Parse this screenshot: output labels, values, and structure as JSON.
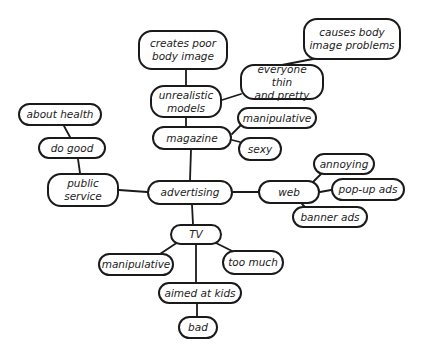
{
  "diagram": {
    "type": "mind-map",
    "central_topic": "advertising",
    "nodes": [
      {
        "id": "advertising",
        "label": "advertising",
        "x": 147,
        "y": 180,
        "w": 86,
        "h": 25
      },
      {
        "id": "magazine",
        "label": "magazine",
        "x": 152,
        "y": 126,
        "w": 80,
        "h": 24
      },
      {
        "id": "unrealistic_models",
        "label": "unrealistic\nmodels",
        "x": 150,
        "y": 85,
        "w": 72,
        "h": 33
      },
      {
        "id": "creates_poor_body_image",
        "label": "creates poor\nbody image",
        "x": 138,
        "y": 30,
        "w": 90,
        "h": 40
      },
      {
        "id": "everyone_thin_and_pretty",
        "label": "everyone thin\nand pretty",
        "x": 240,
        "y": 64,
        "w": 84,
        "h": 36
      },
      {
        "id": "causes_body_image_problems",
        "label": "causes body\nimage problems",
        "x": 303,
        "y": 18,
        "w": 98,
        "h": 42
      },
      {
        "id": "manipulative_mag",
        "label": "manipulative",
        "x": 237,
        "y": 107,
        "w": 80,
        "h": 22
      },
      {
        "id": "sexy",
        "label": "sexy",
        "x": 238,
        "y": 137,
        "w": 44,
        "h": 24
      },
      {
        "id": "public_service",
        "label": "public\nservice",
        "x": 47,
        "y": 173,
        "w": 72,
        "h": 34
      },
      {
        "id": "do_good",
        "label": "do good",
        "x": 38,
        "y": 137,
        "w": 68,
        "h": 22
      },
      {
        "id": "about_health",
        "label": "about health",
        "x": 18,
        "y": 103,
        "w": 84,
        "h": 23
      },
      {
        "id": "web",
        "label": "web",
        "x": 258,
        "y": 180,
        "w": 62,
        "h": 24
      },
      {
        "id": "annoying",
        "label": "annoying",
        "x": 313,
        "y": 153,
        "w": 62,
        "h": 22
      },
      {
        "id": "pop_up_ads",
        "label": "pop-up ads",
        "x": 331,
        "y": 178,
        "w": 74,
        "h": 23
      },
      {
        "id": "banner_ads",
        "label": "banner ads",
        "x": 292,
        "y": 206,
        "w": 76,
        "h": 22
      },
      {
        "id": "tv",
        "label": "TV",
        "x": 170,
        "y": 224,
        "w": 52,
        "h": 21
      },
      {
        "id": "manipulative_tv",
        "label": "manipulative",
        "x": 98,
        "y": 253,
        "w": 76,
        "h": 23
      },
      {
        "id": "too_much",
        "label": "too much",
        "x": 222,
        "y": 250,
        "w": 62,
        "h": 25
      },
      {
        "id": "aimed_at_kids",
        "label": "aimed at kids",
        "x": 158,
        "y": 282,
        "w": 84,
        "h": 22
      },
      {
        "id": "bad",
        "label": "bad",
        "x": 178,
        "y": 316,
        "w": 40,
        "h": 23
      }
    ],
    "edges": [
      {
        "from": "advertising",
        "to": "magazine",
        "x1": 190,
        "y1": 180,
        "x2": 191,
        "y2": 150
      },
      {
        "from": "magazine",
        "to": "unrealistic_models",
        "x1": 186,
        "y1": 126,
        "x2": 186,
        "y2": 118
      },
      {
        "from": "unrealistic_models",
        "to": "creates_poor_body_image",
        "x1": 186,
        "y1": 85,
        "x2": 186,
        "y2": 70
      },
      {
        "from": "unrealistic_models",
        "to": "everyone_thin_and_pretty",
        "x1": 222,
        "y1": 100,
        "x2": 241,
        "y2": 94
      },
      {
        "from": "everyone_thin_and_pretty",
        "to": "causes_body_image_problems",
        "x1": 282,
        "y1": 65,
        "x2": 318,
        "y2": 58
      },
      {
        "from": "magazine",
        "to": "manipulative_mag",
        "x1": 232,
        "y1": 134,
        "x2": 242,
        "y2": 124
      },
      {
        "from": "magazine",
        "to": "sexy",
        "x1": 232,
        "y1": 140,
        "x2": 240,
        "y2": 142
      },
      {
        "from": "advertising",
        "to": "public_service",
        "x1": 147,
        "y1": 192,
        "x2": 119,
        "y2": 190
      },
      {
        "from": "public_service",
        "to": "do_good",
        "x1": 80,
        "y1": 173,
        "x2": 78,
        "y2": 159
      },
      {
        "from": "do_good",
        "to": "about_health",
        "x1": 70,
        "y1": 137,
        "x2": 64,
        "y2": 126
      },
      {
        "from": "advertising",
        "to": "web",
        "x1": 233,
        "y1": 192,
        "x2": 258,
        "y2": 192
      },
      {
        "from": "web",
        "to": "annoying",
        "x1": 311,
        "y1": 184,
        "x2": 322,
        "y2": 173
      },
      {
        "from": "web",
        "to": "pop_up_ads",
        "x1": 320,
        "y1": 192,
        "x2": 331,
        "y2": 190
      },
      {
        "from": "web",
        "to": "banner_ads",
        "x1": 302,
        "y1": 204,
        "x2": 306,
        "y2": 208
      },
      {
        "from": "advertising",
        "to": "tv",
        "x1": 192,
        "y1": 205,
        "x2": 193,
        "y2": 224
      },
      {
        "from": "tv",
        "to": "manipulative_tv",
        "x1": 178,
        "y1": 242,
        "x2": 160,
        "y2": 254
      },
      {
        "from": "tv",
        "to": "too_much",
        "x1": 214,
        "y1": 242,
        "x2": 234,
        "y2": 252
      },
      {
        "from": "tv",
        "to": "aimed_at_kids",
        "x1": 196,
        "y1": 245,
        "x2": 196,
        "y2": 282
      },
      {
        "from": "aimed_at_kids",
        "to": "bad",
        "x1": 197,
        "y1": 304,
        "x2": 197,
        "y2": 316
      }
    ],
    "colors": {
      "stroke": "#1a1a1a",
      "text": "#222222",
      "background": "#ffffff"
    }
  }
}
